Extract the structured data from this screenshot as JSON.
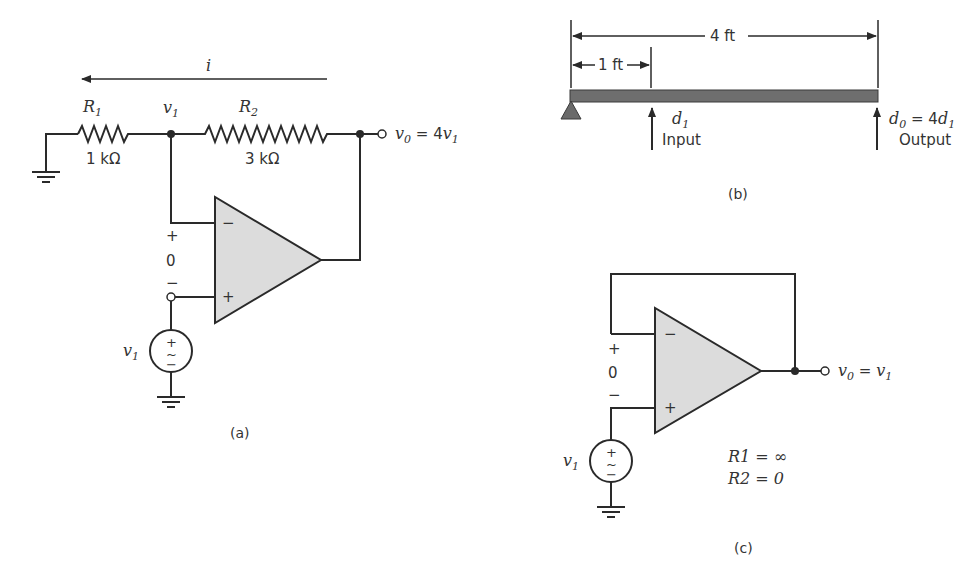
{
  "figure_a": {
    "current_label": "i",
    "r1_label": "R",
    "r1_sub": "1",
    "r1_value": "1 kΩ",
    "r2_label": "R",
    "r2_sub": "2",
    "r2_value": "3 kΩ",
    "node_label": "v",
    "node_sub": "1",
    "output_label_v": "v",
    "output_label_sub": "0",
    "output_label_eq": " = 4",
    "output_label_v1": "v",
    "output_label_v1_sub": "1",
    "diff_plus": "+",
    "diff_value": "0",
    "diff_minus": "−",
    "opamp_minus": "−",
    "opamp_plus": "+",
    "source_label": "v",
    "source_sub": "1",
    "source_plus": "+",
    "source_tilde": "~",
    "source_minus": "−",
    "caption": "(a)"
  },
  "figure_b": {
    "total_length": "4 ft",
    "input_length": "1 ft",
    "input_label": "d",
    "input_sub": "1",
    "input_text": "Input",
    "output_label": "d",
    "output_sub": "0",
    "output_eq": " = 4",
    "output_d1": "d",
    "output_d1_sub": "1",
    "output_text": "Output",
    "caption": "(b)"
  },
  "figure_c": {
    "output_label_v": "v",
    "output_label_sub": "0",
    "output_label_eq": " = ",
    "output_label_v1": "v",
    "output_label_v1_sub": "1",
    "diff_plus": "+",
    "diff_value": "0",
    "diff_minus": "−",
    "opamp_minus": "−",
    "opamp_plus": "+",
    "source_label": "v",
    "source_sub": "1",
    "source_plus": "+",
    "source_tilde": "~",
    "source_minus": "−",
    "r1_eq": "R1 = ∞",
    "r2_eq": "R2 = 0",
    "caption": "(c)"
  }
}
